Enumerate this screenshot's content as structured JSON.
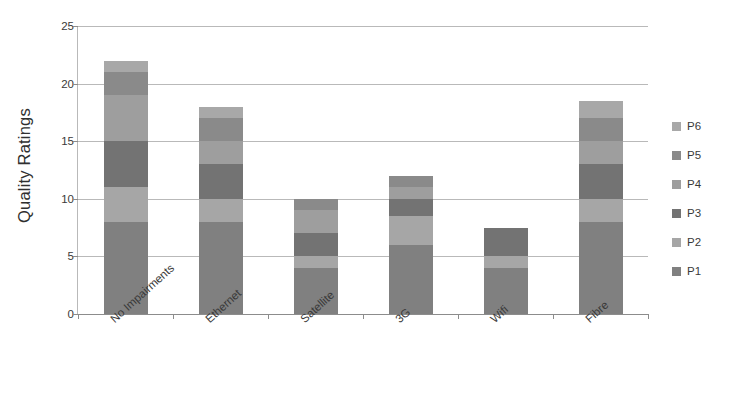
{
  "chart_data": {
    "type": "bar",
    "stacked": true,
    "title": "",
    "xlabel": "",
    "ylabel": "Quality Ratings",
    "ylim": [
      0,
      25
    ],
    "yticks": [
      0,
      5,
      10,
      15,
      20,
      25
    ],
    "grid": true,
    "legend_position": "right",
    "categories": [
      "No Impairments",
      "Ethernet",
      "Satellite",
      "3G",
      "Wifi",
      "Fibre"
    ],
    "series": [
      {
        "name": "P1",
        "color": "#808080",
        "values": [
          8,
          8,
          4,
          6,
          4,
          8
        ]
      },
      {
        "name": "P2",
        "color": "#a6a6a6",
        "values": [
          3,
          2,
          1,
          2.5,
          1,
          2
        ]
      },
      {
        "name": "P3",
        "color": "#737373",
        "values": [
          4,
          3,
          2,
          1.5,
          2.5,
          3
        ]
      },
      {
        "name": "P4",
        "color": "#9e9e9e",
        "values": [
          4,
          2,
          2,
          1,
          0,
          2
        ]
      },
      {
        "name": "P5",
        "color": "#8a8a8a",
        "values": [
          2,
          2,
          1,
          1,
          0,
          2
        ]
      },
      {
        "name": "P6",
        "color": "#a8a8a8",
        "values": [
          1,
          1,
          0,
          0,
          0,
          1.5
        ]
      }
    ],
    "totals": [
      22,
      18,
      10,
      12,
      7.5,
      18.5
    ],
    "legend_entries": [
      "P6",
      "P5",
      "P4",
      "P3",
      "P2",
      "P1"
    ]
  },
  "axis": {
    "y_title": "Quality Ratings"
  },
  "colors": {
    "gridline": "#b9b9b9",
    "axis": "#8c8c8c",
    "text": "#3a3a3a",
    "background": "#ffffff"
  }
}
